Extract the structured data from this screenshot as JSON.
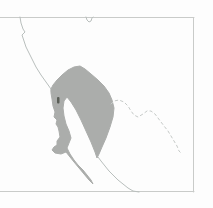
{
  "map": {
    "canvas": {
      "width": 213,
      "height": 208,
      "background": "#fdfdfd"
    },
    "colors": {
      "frame": "#c9cbc9",
      "coastline": "#b9bfbd",
      "border": "#c6cac8",
      "range": "#abadab",
      "mark": "#5a5e57"
    },
    "features": [
      {
        "name": "map-frame-top",
        "type": "polyline",
        "stroke": "frame",
        "points": [
          [
            0,
            17.5
          ],
          [
            194,
            17.5
          ]
        ]
      },
      {
        "name": "map-frame-right",
        "type": "polyline",
        "stroke": "frame",
        "points": [
          [
            193.5,
            17.5
          ],
          [
            193.5,
            192
          ]
        ]
      },
      {
        "name": "map-frame-bottom",
        "type": "polyline",
        "stroke": "frame",
        "points": [
          [
            0,
            191.5
          ],
          [
            194,
            191.5
          ]
        ]
      },
      {
        "name": "pacific-coastline",
        "type": "polyline",
        "stroke": "coastline",
        "points": [
          [
            20,
            17
          ],
          [
            21,
            23
          ],
          [
            23,
            29
          ],
          [
            25,
            32
          ],
          [
            22,
            35
          ],
          [
            24,
            41
          ],
          [
            26,
            47
          ],
          [
            29,
            53
          ],
          [
            32,
            59
          ],
          [
            36,
            67
          ],
          [
            41,
            75
          ],
          [
            46,
            82
          ],
          [
            51,
            89
          ]
        ]
      },
      {
        "name": "river-inlet",
        "type": "polyline",
        "stroke": "coastline",
        "points": [
          [
            86,
            17
          ],
          [
            87,
            20
          ],
          [
            89,
            22
          ],
          [
            91,
            21
          ],
          [
            92,
            18
          ],
          [
            93,
            17
          ]
        ]
      },
      {
        "name": "range-area",
        "type": "polygon",
        "fill": "range",
        "points": [
          [
            51,
            89
          ],
          [
            53,
            85
          ],
          [
            57,
            80
          ],
          [
            62,
            75
          ],
          [
            68,
            70
          ],
          [
            74,
            67
          ],
          [
            80,
            66
          ],
          [
            85,
            69
          ],
          [
            91,
            74
          ],
          [
            98,
            80
          ],
          [
            104,
            86
          ],
          [
            109,
            93
          ],
          [
            112,
            100
          ],
          [
            114,
            108
          ],
          [
            113,
            117
          ],
          [
            110,
            127
          ],
          [
            106,
            138
          ],
          [
            102,
            147
          ],
          [
            99,
            154
          ],
          [
            97,
            158
          ],
          [
            95,
            152
          ],
          [
            91,
            142
          ],
          [
            86,
            131
          ],
          [
            81,
            120
          ],
          [
            76,
            110
          ],
          [
            71,
            102
          ],
          [
            67,
            97
          ],
          [
            64,
            101
          ],
          [
            63,
            108
          ],
          [
            64,
            116
          ],
          [
            66,
            124
          ],
          [
            69,
            131
          ],
          [
            71,
            138
          ],
          [
            69,
            143
          ],
          [
            67,
            148
          ],
          [
            70,
            154
          ],
          [
            74,
            160
          ],
          [
            78,
            165
          ],
          [
            83,
            170
          ],
          [
            87,
            175
          ],
          [
            91,
            180
          ],
          [
            93,
            184
          ],
          [
            89,
            180
          ],
          [
            84,
            174
          ],
          [
            79,
            168
          ],
          [
            74,
            162
          ],
          [
            70,
            157
          ],
          [
            66,
            152
          ],
          [
            61,
            154
          ],
          [
            55,
            153
          ],
          [
            52,
            150
          ],
          [
            54,
            147
          ],
          [
            57,
            145
          ],
          [
            57,
            141
          ],
          [
            60,
            137
          ],
          [
            59,
            131
          ],
          [
            58,
            127
          ],
          [
            56,
            124
          ],
          [
            57,
            120
          ],
          [
            54,
            117
          ],
          [
            55,
            112
          ],
          [
            53,
            106
          ],
          [
            52,
            99
          ],
          [
            51,
            93
          ]
        ]
      },
      {
        "name": "range-dark-mark",
        "type": "rect",
        "fill": "mark",
        "x": 57,
        "y": 97,
        "w": 2.5,
        "h": 6.5,
        "rx": 1
      },
      {
        "name": "state-border-dashed",
        "type": "polyline",
        "stroke": "border",
        "dash": "2.5 3",
        "points": [
          [
            111,
            104
          ],
          [
            114,
            101
          ],
          [
            119,
            100
          ],
          [
            124,
            102
          ],
          [
            128,
            106
          ],
          [
            131,
            111
          ],
          [
            134,
            115
          ],
          [
            138,
            117
          ],
          [
            143,
            114
          ],
          [
            147,
            111
          ],
          [
            151,
            111
          ],
          [
            155,
            114
          ],
          [
            158,
            118
          ],
          [
            161,
            122
          ],
          [
            164,
            126
          ],
          [
            168,
            131
          ],
          [
            171,
            136
          ],
          [
            174,
            141
          ],
          [
            177,
            146
          ],
          [
            179,
            151
          ],
          [
            181,
            153
          ]
        ]
      },
      {
        "name": "mainland-coastline",
        "type": "polyline",
        "stroke": "coastline",
        "points": [
          [
            98,
            157
          ],
          [
            101,
            161
          ],
          [
            105,
            166
          ],
          [
            109,
            171
          ],
          [
            113,
            175
          ],
          [
            118,
            180
          ],
          [
            123,
            184
          ],
          [
            128,
            188
          ],
          [
            133,
            191
          ],
          [
            139,
            192
          ]
        ]
      }
    ]
  }
}
